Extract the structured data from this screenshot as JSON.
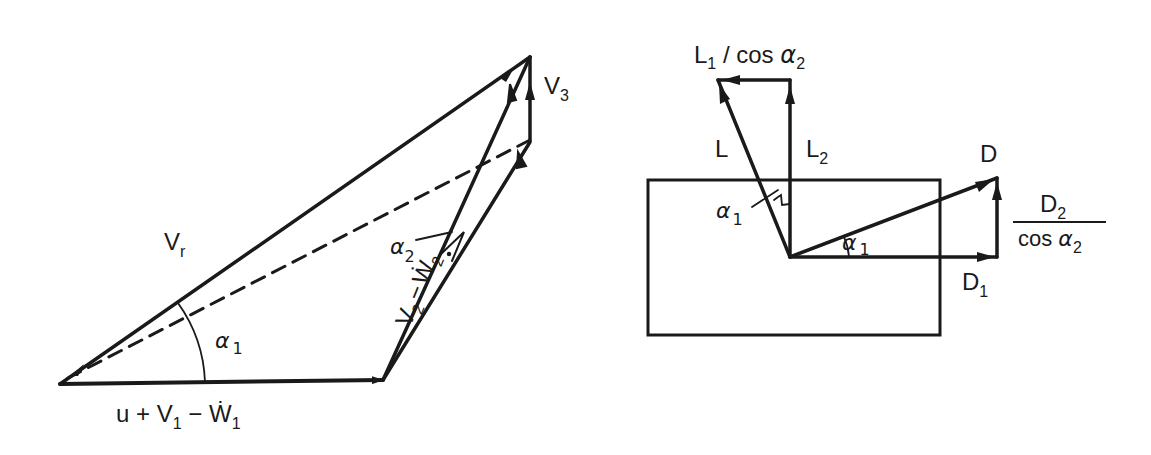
{
  "figure": {
    "background": "#ffffff",
    "ink": "#1a1a1a",
    "left_diagram": {
      "name": "velocity-triangle",
      "labels": {
        "vr": "V",
        "vr_sub": "r",
        "v3": "V",
        "v3_sub": "3",
        "alpha1": "α",
        "alpha1_sub": "1",
        "alpha2": "α",
        "alpha2_sub": "2",
        "v2w2_v": "V",
        "v2w2_v_sub": "2",
        "v2w2_minus": "−",
        "v2w2_w": "Ẇ",
        "v2w2_w_sub": "2",
        "base_u": "u + V",
        "base_sub1": "1",
        "base_minus": " − Ẇ",
        "base_sub2": "1"
      },
      "points": {
        "origin": [
          60,
          384
        ],
        "base_end": [
          383,
          380
        ],
        "apex": [
          530,
          57
        ],
        "mid": [
          530,
          140
        ]
      }
    },
    "right_diagram": {
      "name": "force-decomposition",
      "labels": {
        "l1cos": "L",
        "l1cos_sub": "1",
        "l1cos_rest": " / cos ",
        "l1cos_alpha": "α",
        "l1cos_alpha_sub": "2",
        "l": "L",
        "l2": "L",
        "l2_sub": "2",
        "d": "D",
        "d1": "D",
        "d1_sub": "1",
        "d2": "D",
        "d2_sub": "2",
        "d2_den": "cos ",
        "d2_den_alpha": "α",
        "d2_den_alpha_sub": "2",
        "alpha1_left": "α",
        "alpha1_left_sub": "1",
        "alpha1_right": "α",
        "alpha1_right_sub": "1"
      },
      "rectangle": {
        "x": 648,
        "y": 180,
        "w": 292,
        "h": 155
      },
      "points": {
        "origin": [
          790,
          257
        ],
        "l2_top": [
          790,
          80
        ],
        "l_tip": [
          718,
          80
        ],
        "d_tip": [
          997,
          178
        ],
        "d1_tip": [
          997,
          257
        ]
      }
    }
  }
}
